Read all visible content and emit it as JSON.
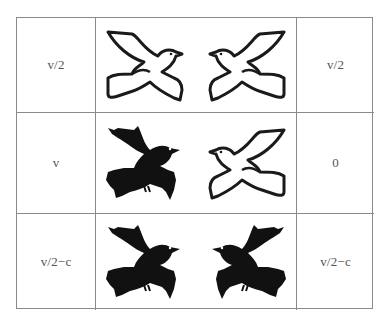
{
  "table": {
    "rows": [
      {
        "left_payoff": "v/2",
        "left_bird": "dove-icon",
        "right_bird": "dove-icon",
        "right_payoff": "v/2"
      },
      {
        "left_payoff": "v",
        "left_bird": "hawk-icon",
        "right_bird": "dove-icon",
        "right_payoff": "0"
      },
      {
        "left_payoff": "v/2−c",
        "left_bird": "hawk-icon",
        "right_bird": "hawk-icon",
        "right_payoff": "v/2−c"
      }
    ]
  },
  "colors": {
    "border": "#8a8a8a",
    "text": "#555555",
    "bird_outline": "#1a1a1a",
    "hawk_fill": "#111111"
  }
}
